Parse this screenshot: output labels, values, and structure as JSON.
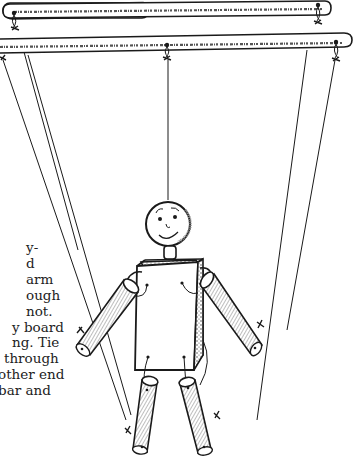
{
  "document": {
    "type": "craft-instructions-page-fragment",
    "illustration": {
      "subject": "marionette-puppet",
      "parts": [
        "upper-control-bar",
        "lower-control-bar",
        "head",
        "neck",
        "body-block",
        "left-arm",
        "right-arm",
        "left-leg",
        "right-leg",
        "strings",
        "knots"
      ]
    },
    "text_lines": [
      {
        "text": "y-",
        "indent": 28
      },
      {
        "text": "d",
        "indent": 28
      },
      {
        "text": "arm",
        "indent": 28
      },
      {
        "text": "ough",
        "indent": 28
      },
      {
        "text": "not.",
        "indent": 28
      },
      {
        "text": "y board",
        "indent": 14
      },
      {
        "text": "ng. Tie",
        "indent": 14
      },
      {
        "text": "through",
        "indent": 6
      },
      {
        "text": "other end",
        "indent": 0
      },
      {
        "text": "bar and",
        "indent": 0
      }
    ],
    "colors": {
      "ink": "#1a1a1a",
      "paper": "#ffffff",
      "text": "#222222"
    }
  }
}
